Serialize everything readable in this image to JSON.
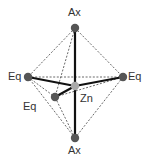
{
  "colors": {
    "background": "#ffffff",
    "bond": "#111111",
    "edge": "#444444",
    "atom": "#555555",
    "center_atom": "#aaaaaa",
    "label": "#333333"
  },
  "atoms": [
    {
      "id": "ax_top",
      "label": "Ax",
      "x": 75,
      "y": 28,
      "r": 4.2
    },
    {
      "id": "eq_left",
      "label": "Eq",
      "x": 28,
      "y": 77,
      "r": 4.2
    },
    {
      "id": "eq_right",
      "label": "Eq",
      "x": 123,
      "y": 77,
      "r": 4.2
    },
    {
      "id": "eq_front",
      "label": "Eq",
      "x": 55,
      "y": 97,
      "r": 4.2
    },
    {
      "id": "ax_bottom",
      "label": "Ax",
      "x": 75,
      "y": 138,
      "r": 4.2
    },
    {
      "id": "zn",
      "label": "Zn",
      "x": 75,
      "y": 86,
      "r": 4.2,
      "center": true
    }
  ],
  "labels": [
    {
      "id": "ax_top_label",
      "text": "Ax",
      "x": 68,
      "y": 7
    },
    {
      "id": "eq_left_label",
      "text": "Eq",
      "x": 8,
      "y": 71
    },
    {
      "id": "eq_right_label",
      "text": "Eq",
      "x": 128,
      "y": 71
    },
    {
      "id": "eq_front_label",
      "text": "Eq",
      "x": 23,
      "y": 101
    },
    {
      "id": "zn_label",
      "text": "Zn",
      "x": 80,
      "y": 93
    },
    {
      "id": "ax_bottom_label",
      "text": "Ax",
      "x": 68,
      "y": 145
    }
  ],
  "bonds": [
    {
      "from": "zn",
      "to": "ax_top"
    },
    {
      "from": "zn",
      "to": "ax_bottom"
    },
    {
      "from": "zn",
      "to": "eq_left"
    },
    {
      "from": "zn",
      "to": "eq_right"
    },
    {
      "from": "zn",
      "to": "eq_front"
    }
  ],
  "edges": [
    {
      "from": "ax_top",
      "to": "eq_left"
    },
    {
      "from": "ax_top",
      "to": "eq_right"
    },
    {
      "from": "ax_top",
      "to": "eq_front"
    },
    {
      "from": "ax_bottom",
      "to": "eq_left"
    },
    {
      "from": "ax_bottom",
      "to": "eq_right"
    },
    {
      "from": "ax_bottom",
      "to": "eq_front"
    },
    {
      "from": "eq_left",
      "to": "eq_right"
    },
    {
      "from": "eq_left",
      "to": "eq_front"
    },
    {
      "from": "eq_front",
      "to": "eq_right"
    }
  ]
}
